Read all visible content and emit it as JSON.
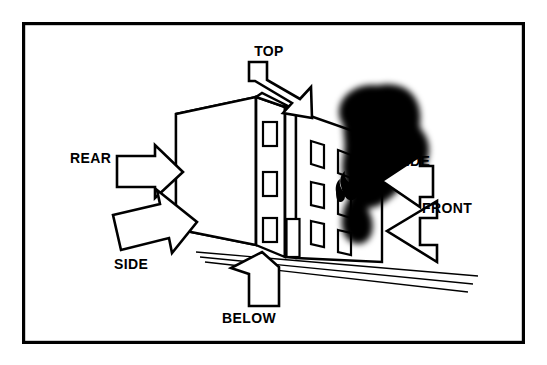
{
  "figure": {
    "background_color": "#ffffff",
    "ink_color": "#000000",
    "frame": {
      "name": "outer-border",
      "x": 22,
      "y": 22,
      "width": 503,
      "height": 322,
      "stroke_width": 3.2
    }
  },
  "labels": [
    {
      "id": "top",
      "text": "TOP",
      "x": 269,
      "y": 56,
      "anchor": "middle"
    },
    {
      "id": "rear",
      "text": "REAR",
      "x": 70,
      "y": 163,
      "anchor": "start"
    },
    {
      "id": "side_left",
      "text": "SIDE",
      "x": 114,
      "y": 269,
      "anchor": "start"
    },
    {
      "id": "below",
      "text": "BELOW",
      "x": 222,
      "y": 323,
      "anchor": "start"
    },
    {
      "id": "side_right",
      "text": "SIDE",
      "x": 396,
      "y": 166,
      "anchor": "start"
    },
    {
      "id": "front",
      "text": "FRONT",
      "x": 422,
      "y": 213,
      "anchor": "start"
    }
  ],
  "arrows": [
    {
      "id": "arrow-top",
      "label": "TOP",
      "direction": "down-left toward roof",
      "points": "248,60 262,60 262,60 300,98 310,88 310,115 283,115 292,106 254,70 248,70"
    },
    {
      "id": "arrow-rear",
      "label": "REAR",
      "direction": "right toward rear wall",
      "points": "119,157 155,157 155,148 181,171 155,194 155,185 119,185"
    },
    {
      "id": "arrow-side-left",
      "label": "SIDE",
      "direction": "right-up toward lower rear corner",
      "points": "115,213 162,203 160,189 196,221 172,251 170,237 123,247"
    },
    {
      "id": "arrow-below",
      "label": "BELOW",
      "direction": "up-left toward building base",
      "points": "262,252 276,264 276,305 249,305 249,272 233,264 262,252"
    },
    {
      "id": "arrow-side-right",
      "label": "SIDE",
      "direction": "left toward right side wall",
      "points": "417,158 417,165 425,165 425,195 417,195 417,202 381,180"
    },
    {
      "id": "arrow-front",
      "label": "FRONT",
      "direction": "left-down toward front facade",
      "points": "434,202 434,217 418,217 418,243 434,243 434,258 387,230"
    }
  ],
  "building": {
    "name": "multi-story-building",
    "stories": 3,
    "faces": [
      {
        "id": "rear-face",
        "name": "rear-wall",
        "hatched_band": true
      },
      {
        "id": "front-face",
        "name": "front-wall",
        "windows": 3,
        "door": 1
      },
      {
        "id": "side-face",
        "name": "side-wall",
        "windows": 6
      }
    ],
    "hatch": {
      "name": "rear-wall-hatch-band",
      "pattern": "diagonal-lines",
      "spacing": 4,
      "angle": 45
    }
  },
  "fire": {
    "smoke_plume": {
      "name": "smoke-plume",
      "color": "#000000",
      "position": "upper right of building",
      "blur": 7
    },
    "flame": {
      "name": "flame-from-window",
      "color": "#000000",
      "position": "second story right side window"
    }
  }
}
